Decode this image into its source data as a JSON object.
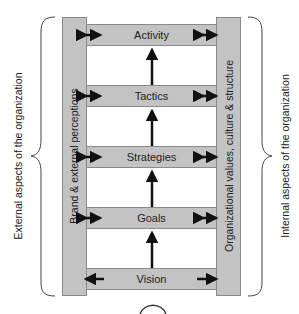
{
  "diagram": {
    "levels": [
      {
        "label": "Activity",
        "left_arrow": "bidirectional",
        "right_arrow": "bidirectional"
      },
      {
        "label": "Tactics",
        "left_arrow": "bidirectional",
        "right_arrow": "bidirectional"
      },
      {
        "label": "Strategies",
        "left_arrow": "bidirectional",
        "right_arrow": "bidirectional"
      },
      {
        "label": "Goals",
        "left_arrow": "bidirectional",
        "right_arrow": "bidirectional"
      },
      {
        "label": "Vision",
        "left_arrow": "left",
        "right_arrow": "right"
      }
    ],
    "left_pillar": {
      "label": "Brand & external perceptions"
    },
    "right_pillar": {
      "label": "Organizational values, culture & structure"
    },
    "left_brace": {
      "label": "External aspects of the organization"
    },
    "right_brace": {
      "label": "Internal aspects of the organization"
    },
    "colors": {
      "fill": "#c3c3c3",
      "stroke": "#8a8a8a",
      "arrow": "#111111"
    }
  }
}
